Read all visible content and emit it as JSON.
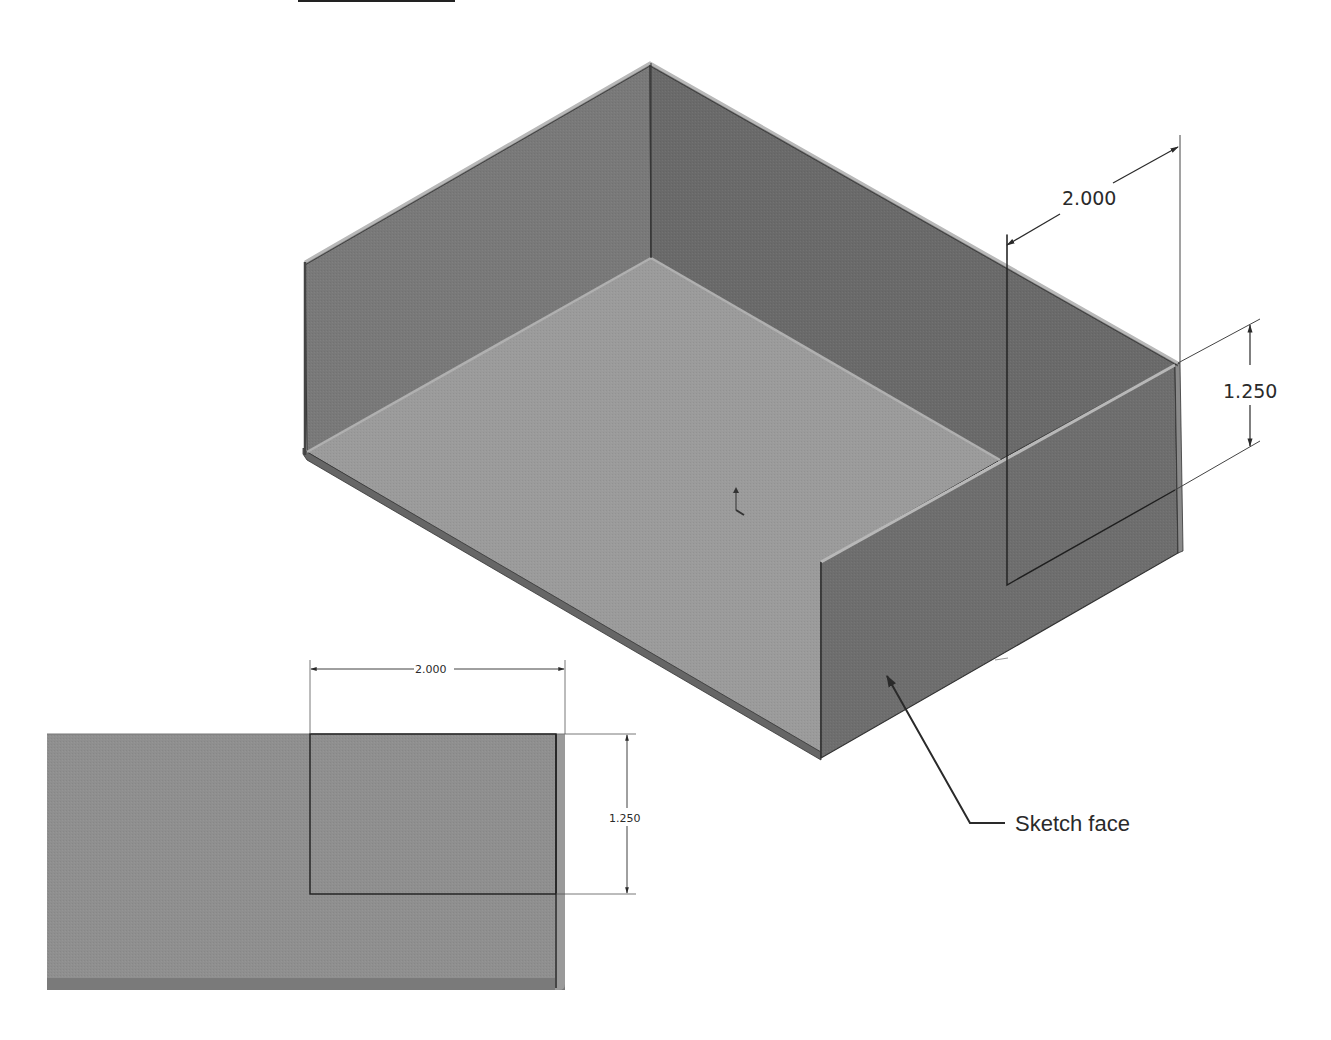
{
  "figure": {
    "type": "sheet-metal-box-sketch-illustration",
    "header_underline": true
  },
  "iso_view": {
    "label": "Isometric view of sheet metal tray",
    "dimensions": {
      "width": "2.000",
      "height": "1.250"
    },
    "callout": {
      "label": "Sketch face"
    }
  },
  "front_view": {
    "label": "Normal-to view of sketch face",
    "dimensions": {
      "width": "2.000",
      "height": "1.250"
    }
  },
  "colors": {
    "background": "#ffffff",
    "wall_dark": "#6f6f6f",
    "wall_mid": "#7d7d7d",
    "floor": "#9a9a9a",
    "edge_highlight": "#b5b5b5",
    "line": "#2a2a2a",
    "front_panel": "#8e8e8e"
  }
}
